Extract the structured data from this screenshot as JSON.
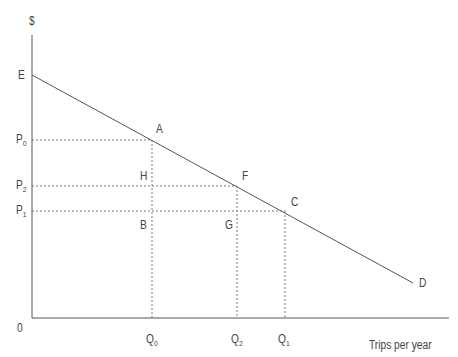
{
  "diagram": {
    "type": "demand-curve",
    "y_axis_label": "$",
    "x_axis_label": "Trips per year",
    "origin_label": "0",
    "intercept_label": "E",
    "end_label": "D",
    "points": [
      {
        "label": "A",
        "x": 152,
        "y": 140
      },
      {
        "label": "F",
        "x": 237,
        "y": 186
      },
      {
        "label": "C",
        "x": 285,
        "y": 211
      },
      {
        "label": "H",
        "x": 152,
        "y": 186
      },
      {
        "label": "B",
        "x": 152,
        "y": 211
      },
      {
        "label": "G",
        "x": 237,
        "y": 211
      }
    ],
    "price_labels": [
      {
        "base": "P",
        "sub": "0"
      },
      {
        "base": "P",
        "sub": "2"
      },
      {
        "base": "P",
        "sub": "1"
      }
    ],
    "quantity_labels": [
      {
        "base": "Q",
        "sub": "0"
      },
      {
        "base": "Q",
        "sub": "2"
      },
      {
        "base": "Q",
        "sub": "1"
      }
    ],
    "colors": {
      "line": "#555555",
      "dotted": "#777777",
      "text": "#444444"
    }
  }
}
